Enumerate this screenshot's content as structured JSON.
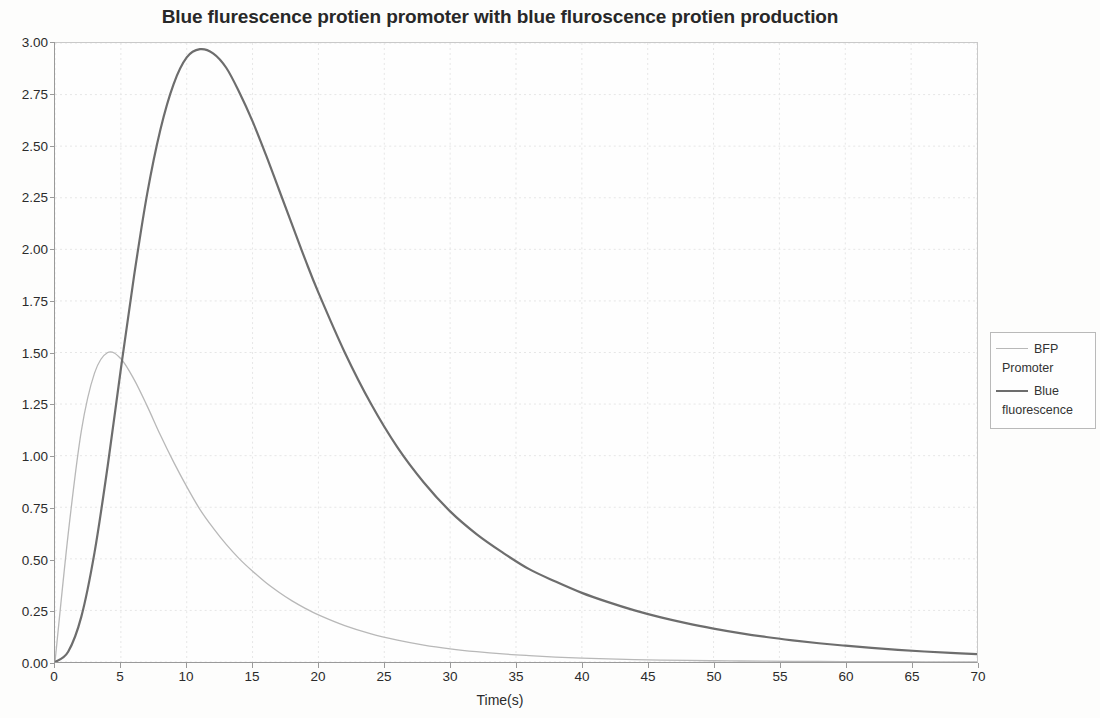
{
  "chart_data": {
    "type": "line",
    "title": "Blue flurescence protien promoter with blue fluroscence protien production",
    "xlabel": "Time(s)",
    "ylabel": "",
    "xlim": [
      0,
      70
    ],
    "ylim": [
      0,
      3.0
    ],
    "grid": true,
    "legend_position": "right-outside",
    "xticks": [
      "0",
      "5",
      "10",
      "15",
      "20",
      "25",
      "30",
      "35",
      "40",
      "45",
      "50",
      "55",
      "60",
      "65",
      "70"
    ],
    "yticks": [
      "0.00",
      "0.25",
      "0.50",
      "0.75",
      "1.00",
      "1.25",
      "1.50",
      "1.75",
      "2.00",
      "2.25",
      "2.50",
      "2.75",
      "3.00"
    ],
    "x": [
      0,
      1,
      2,
      3,
      4,
      5,
      6,
      7,
      8,
      9,
      10,
      11,
      12,
      13,
      14,
      15,
      16,
      17,
      18,
      19,
      20,
      22,
      24,
      26,
      28,
      30,
      32,
      34,
      36,
      38,
      40,
      42,
      44,
      46,
      48,
      50,
      52,
      54,
      56,
      58,
      60,
      62,
      64,
      66,
      68,
      70
    ],
    "series": [
      {
        "name": "BFP Promoter",
        "color": "#b8b8b8",
        "line_width": 1.3,
        "peak_x": 4,
        "peak_y": 1.5,
        "values": [
          0.0,
          0.62,
          1.12,
          1.4,
          1.5,
          1.47,
          1.37,
          1.24,
          1.1,
          0.97,
          0.85,
          0.74,
          0.65,
          0.57,
          0.5,
          0.44,
          0.385,
          0.338,
          0.296,
          0.26,
          0.228,
          0.176,
          0.136,
          0.106,
          0.082,
          0.064,
          0.05,
          0.039,
          0.031,
          0.024,
          0.019,
          0.015,
          0.012,
          0.0095,
          0.0075,
          0.006,
          0.0048,
          0.0038,
          0.003,
          0.0024,
          0.0019,
          0.0015,
          0.0012,
          0.001,
          0.0008,
          0.0006
        ]
      },
      {
        "name": "Blue fluorescence",
        "color": "#6d6d6d",
        "line_width": 2.2,
        "peak_x": 11,
        "peak_y": 2.97,
        "values": [
          0.0,
          0.05,
          0.22,
          0.53,
          0.95,
          1.42,
          1.87,
          2.27,
          2.58,
          2.8,
          2.93,
          2.97,
          2.95,
          2.88,
          2.76,
          2.62,
          2.46,
          2.29,
          2.12,
          1.95,
          1.79,
          1.5,
          1.25,
          1.04,
          0.87,
          0.73,
          0.62,
          0.53,
          0.45,
          0.39,
          0.335,
          0.29,
          0.25,
          0.216,
          0.187,
          0.162,
          0.14,
          0.121,
          0.105,
          0.091,
          0.079,
          0.068,
          0.059,
          0.051,
          0.044,
          0.038
        ]
      }
    ]
  },
  "legend": {
    "entries": [
      {
        "line1": "BFP",
        "line2": "Promoter"
      },
      {
        "line1": "Blue",
        "line2": "fluorescence"
      }
    ]
  },
  "colors": {
    "bfp_promoter": "#b8b8b8",
    "blue_fluorescence": "#6d6d6d",
    "axis": "#9a9a9a",
    "grid": "#e6e6e6",
    "text": "#2b2b2b"
  }
}
